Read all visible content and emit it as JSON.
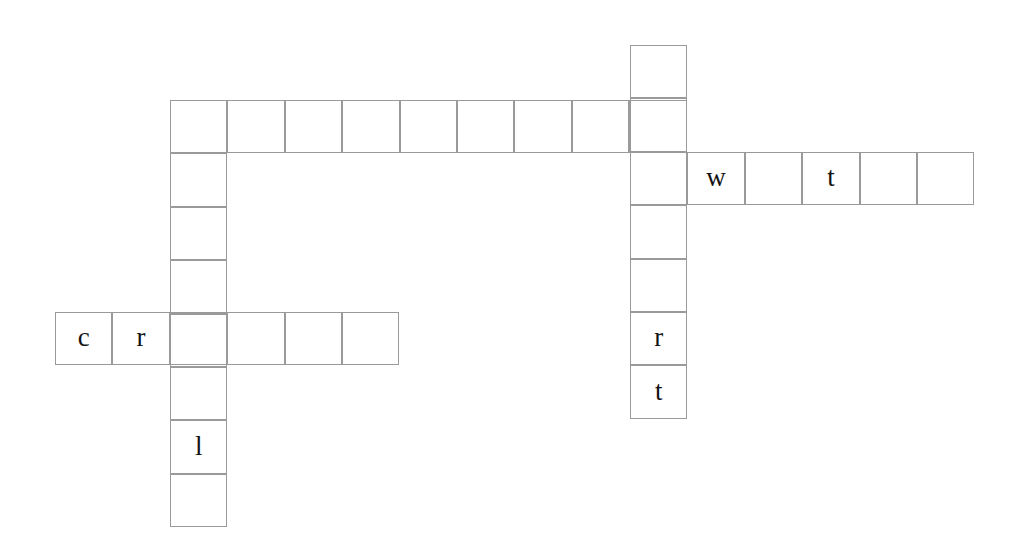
{
  "puzzle": {
    "type": "crossword-grid",
    "background_color": "#ffffff",
    "cell_border_color": "#9a9a9a",
    "letter_color": "#121212",
    "cell_width": 57.4,
    "cell_height": 53.4,
    "entries": [
      {
        "name": "across-top-row",
        "direction": "across",
        "x": 170,
        "y": 100,
        "length": 9,
        "letters": [
          "",
          "",
          "",
          "",
          "",
          "",
          "",
          "",
          ""
        ]
      },
      {
        "name": "across-w-t-row",
        "direction": "across",
        "x": 630,
        "y": 152,
        "length": 6,
        "letters": [
          "",
          "w",
          "",
          "t",
          "",
          ""
        ]
      },
      {
        "name": "across-c-r-row",
        "direction": "across",
        "x": 55,
        "y": 312,
        "length": 6,
        "letters": [
          "c",
          "r",
          "",
          "",
          "",
          ""
        ]
      },
      {
        "name": "down-left-column",
        "direction": "down",
        "x": 170,
        "y": 100,
        "length": 8,
        "letters": [
          "",
          "",
          "",
          "",
          "",
          "",
          "l",
          ""
        ]
      },
      {
        "name": "down-right-column",
        "direction": "down",
        "x": 630,
        "y": 45,
        "length": 7,
        "letters": [
          "",
          "",
          "",
          "",
          "",
          "r",
          "t"
        ]
      }
    ]
  }
}
